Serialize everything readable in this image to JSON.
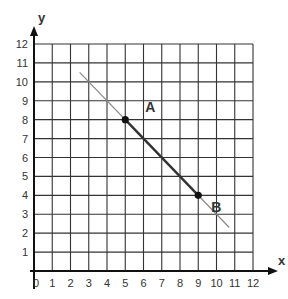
{
  "chart_data": {
    "type": "line",
    "title": "",
    "xlabel": "x",
    "ylabel": "y",
    "xlim": [
      0,
      12
    ],
    "ylim": [
      0,
      12
    ],
    "x_ticks": [
      "0",
      "1",
      "2",
      "3",
      "4",
      "5",
      "6",
      "7",
      "8",
      "9",
      "10",
      "11",
      "12"
    ],
    "y_ticks": [
      "1",
      "2",
      "3",
      "4",
      "5",
      "6",
      "7",
      "8",
      "9",
      "10",
      "11",
      "12"
    ],
    "grid": true,
    "legend": null,
    "series": [
      {
        "name": "line",
        "points": [
          [
            2.5,
            10.5
          ],
          [
            10.7,
            2.3
          ]
        ],
        "color": "#888888"
      },
      {
        "name": "segment AB",
        "points": [
          [
            5,
            8
          ],
          [
            9,
            4
          ]
        ],
        "color": "#333333"
      }
    ],
    "points": [
      {
        "label": "A",
        "x": 5,
        "y": 8
      },
      {
        "label": "B",
        "x": 9,
        "y": 4
      }
    ]
  },
  "colors": {
    "grid": "#333333",
    "axis": "#111111",
    "thin_line": "#8a8a8a",
    "segment": "#333333",
    "point": "#111111",
    "text": "#333333"
  }
}
